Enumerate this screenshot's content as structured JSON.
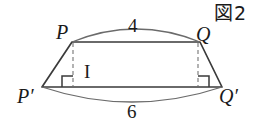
{
  "figure": {
    "caption": "図2",
    "caption_icon": "figure-number-boxed-kanji",
    "shape": "isosceles-trapezoid-with-arcs",
    "vertices": [
      {
        "id": "P",
        "label": "P",
        "x": 72,
        "y": 42
      },
      {
        "id": "Q",
        "label": "Q",
        "x": 200,
        "y": 42
      },
      {
        "id": "Pp",
        "label": "P′",
        "x": 42,
        "y": 87
      },
      {
        "id": "Qp",
        "label": "Q′",
        "x": 222,
        "y": 87
      }
    ],
    "foot_labels": [
      {
        "id": "I",
        "label": "I",
        "x": 73,
        "y": 87
      }
    ],
    "measurements": [
      {
        "id": "top-length",
        "label": "4",
        "edge": "PQ",
        "position": "above-arc"
      },
      {
        "id": "bottom-length",
        "label": "6",
        "edge": "P′Q′",
        "position": "below-arc"
      }
    ],
    "arcs": [
      {
        "id": "top-arc",
        "from": "P",
        "to": "Q",
        "bulge": "up",
        "length_label": "4"
      },
      {
        "id": "bottom-arc",
        "from": "P′",
        "to": "Q′",
        "bulge": "down",
        "length_label": "6"
      }
    ],
    "dashed_segments": [
      {
        "id": "left-altitude",
        "from": "P",
        "to": "I",
        "x": 73
      },
      {
        "id": "right-altitude",
        "from": "Q",
        "to": "H",
        "x": 198
      }
    ],
    "right_angle_marks": [
      {
        "id": "left-right-angle",
        "x": 73,
        "y": 87
      },
      {
        "id": "right-right-angle",
        "x": 198,
        "y": 87
      }
    ],
    "colors": {
      "stroke": "#3a3a3a",
      "arc_stroke": "#6b6b6b",
      "dash_stroke": "#8a8a8a",
      "text": "#1a1a1a",
      "background": "#ffffff"
    }
  }
}
